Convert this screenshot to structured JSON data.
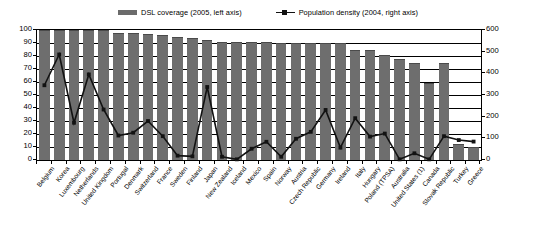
{
  "legend": {
    "position": "top-center",
    "entries": [
      {
        "label": "DSL coverage (2005, left axis)",
        "marker": "bar-swatch-icon",
        "color": "#6e6e6e"
      },
      {
        "label": "Population density (2004, right axis)",
        "marker": "line-square-marker-icon",
        "color": "#121212"
      }
    ]
  },
  "chart_data": {
    "type": "bar",
    "title": "",
    "subtitle": "",
    "xlabel": "",
    "ylabel": "",
    "grid": true,
    "legend_position": "top-center",
    "categories": [
      "Belgium",
      "Korea",
      "Luxembourg",
      "Netherlands",
      "United Kingdom",
      "Portugal",
      "Denmark",
      "Switzerland",
      "France",
      "Sweden",
      "Finland",
      "Japan",
      "New Zealand",
      "Iceland",
      "Mexico",
      "Spain",
      "Norway",
      "Austria",
      "Czech Republic",
      "Germany",
      "Ireland",
      "Italy",
      "Hungary",
      "Poland (TPSA)",
      "Australia",
      "United States (1)",
      "Canada",
      "Slovak Republic",
      "Turkey",
      "Greece"
    ],
    "series": [
      {
        "name": "DSL coverage (2005, left axis)",
        "axis": "left",
        "type": "bar",
        "unit": "%",
        "color": "#6e6e6e",
        "values": [
          100,
          100,
          100,
          100,
          100,
          98,
          98,
          97,
          96,
          95,
          94,
          92,
          91,
          91,
          91,
          91,
          90,
          90,
          90,
          90,
          90,
          85,
          85,
          81,
          78,
          75,
          59,
          75,
          12,
          10
        ]
      },
      {
        "name": "Population density (2004, right axis)",
        "axis": "right",
        "type": "line",
        "unit": "inhabitants per km2",
        "color": "#121212",
        "marker": "square",
        "values": [
          345,
          487,
          172,
          395,
          233,
          113,
          126,
          180,
          110,
          20,
          17,
          337,
          15,
          3,
          52,
          84,
          15,
          98,
          130,
          231,
          57,
          193,
          108,
          122,
          3,
          31,
          3,
          110,
          92,
          85
        ]
      }
    ],
    "left_axis": {
      "min": 0,
      "max": 100,
      "step": 10,
      "ticks": [
        0,
        10,
        20,
        30,
        40,
        50,
        60,
        70,
        80,
        90,
        100
      ]
    },
    "right_axis": {
      "min": 0,
      "max": 600,
      "step": 100,
      "ticks": [
        0,
        100,
        200,
        300,
        400,
        500,
        600
      ]
    }
  }
}
